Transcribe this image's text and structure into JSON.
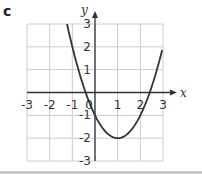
{
  "panel": {
    "label": "c"
  },
  "chart_data": {
    "type": "line",
    "title": "",
    "xlabel": "x",
    "ylabel": "y",
    "xlim": [
      -3,
      3
    ],
    "ylim": [
      -3,
      3
    ],
    "grid": true,
    "x_ticks": [
      -3,
      -2,
      -1,
      0,
      1,
      2,
      3
    ],
    "y_ticks": [
      -3,
      -2,
      -1,
      1,
      2,
      3
    ],
    "x_tick_labels": [
      "-3",
      "-2",
      "-1",
      "0",
      "1",
      "2",
      "3"
    ],
    "y_tick_labels": [
      "3",
      "2",
      "1",
      "-1",
      "-2",
      "-3"
    ],
    "series": [
      {
        "name": "y = x^2 - 2x - 1",
        "x": [
          -1.236,
          -1,
          -0.5,
          0,
          0.5,
          1,
          1.5,
          2,
          2.5,
          3
        ],
        "y": [
          3,
          2,
          0.25,
          -1,
          -1.75,
          -2,
          -1.75,
          -1,
          0.25,
          2
        ]
      }
    ],
    "annotations": {
      "vertex": [
        1,
        -2
      ],
      "y_intercept": -1,
      "x_intercepts": [
        -0.414,
        2.414
      ]
    },
    "colors": {
      "grid": "#cccccc",
      "axes": "#333333",
      "curve": "#333333"
    }
  }
}
